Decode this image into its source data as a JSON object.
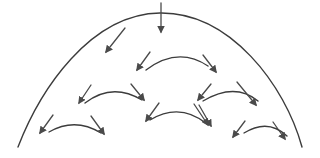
{
  "diagram": {
    "colors": {
      "line": "#3c3c3c",
      "arrow": "#4a4a4a",
      "background": "#ffffff"
    },
    "dome": {
      "path": "M18,147 C40,90 90,14 160,13 C230,12 285,85 302,147"
    },
    "arcs": [
      {
        "id": "arc-row1",
        "path": "M146,70 Q178,46 208,66"
      },
      {
        "id": "arc-row2-left",
        "path": "M85,103 Q112,82 142,100"
      },
      {
        "id": "arc-row2-right",
        "path": "M203,101 Q235,82 258,101"
      },
      {
        "id": "arc-mid-left",
        "path": "M0,0"
      },
      {
        "id": "arc-row3-a",
        "path": "M49,132 Q75,117 101,133"
      },
      {
        "id": "arc-row3-b",
        "path": "M150,120 Q180,102 207,124"
      },
      {
        "id": "arc-row3-c",
        "path": "M244,133 Q268,118 287,136"
      }
    ],
    "arrows": [
      {
        "id": "arrow-top-vertical",
        "x1": 161,
        "y1": 3,
        "x2": 161,
        "y2": 32
      },
      {
        "id": "arrow-top-left",
        "x1": 125,
        "y1": 28,
        "x2": 106,
        "y2": 52
      },
      {
        "id": "arrow-r1-left",
        "x1": 150,
        "y1": 52,
        "x2": 137,
        "y2": 70
      },
      {
        "id": "arrow-r1-right",
        "x1": 203,
        "y1": 55,
        "x2": 216,
        "y2": 72
      },
      {
        "id": "arrow-r2l-left",
        "x1": 91,
        "y1": 85,
        "x2": 79,
        "y2": 103
      },
      {
        "id": "arrow-r2l-right",
        "x1": 131,
        "y1": 84,
        "x2": 144,
        "y2": 100
      },
      {
        "id": "arrow-r2r-left",
        "x1": 211,
        "y1": 84,
        "x2": 198,
        "y2": 100
      },
      {
        "id": "arrow-r2r-right",
        "x1": 237,
        "y1": 82,
        "x2": 256,
        "y2": 105
      },
      {
        "id": "arrow-r3a-left",
        "x1": 53,
        "y1": 115,
        "x2": 40,
        "y2": 133
      },
      {
        "id": "arrow-r3a-right",
        "x1": 91,
        "y1": 116,
        "x2": 104,
        "y2": 134
      },
      {
        "id": "arrow-r3b-left",
        "x1": 159,
        "y1": 103,
        "x2": 146,
        "y2": 121
      },
      {
        "id": "arrow-r3b-right",
        "x1": 194,
        "y1": 104,
        "x2": 208,
        "y2": 125
      },
      {
        "id": "arrow-r3b-right2",
        "x1": 199,
        "y1": 105,
        "x2": 211,
        "y2": 126
      },
      {
        "id": "arrow-r3c-left",
        "x1": 245,
        "y1": 121,
        "x2": 233,
        "y2": 137
      },
      {
        "id": "arrow-r3c-right",
        "x1": 273,
        "y1": 122,
        "x2": 285,
        "y2": 139
      }
    ]
  }
}
